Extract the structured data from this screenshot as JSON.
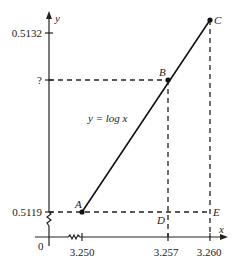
{
  "diagram": {
    "curve_label": "y = log x",
    "axes": {
      "x_label": "x",
      "y_label": "y",
      "origin_label": "0"
    },
    "y_ticks": [
      {
        "label": "0.5132"
      },
      {
        "label": "?"
      },
      {
        "label": "0.5119"
      }
    ],
    "x_ticks": [
      {
        "label": "3.250"
      },
      {
        "label": "3.257"
      },
      {
        "label": "3.260"
      }
    ],
    "points": [
      {
        "label": "A",
        "x": 3.25,
        "y": 0.5119
      },
      {
        "label": "B",
        "x": 3.257,
        "y": "?"
      },
      {
        "label": "C",
        "x": 3.26,
        "y": 0.5132
      },
      {
        "label": "D",
        "x": 3.257,
        "y": 0.5119
      },
      {
        "label": "E",
        "x": 3.26,
        "y": 0.5119
      }
    ],
    "colors": {
      "line": "#111111",
      "background": "#ffffff"
    }
  }
}
